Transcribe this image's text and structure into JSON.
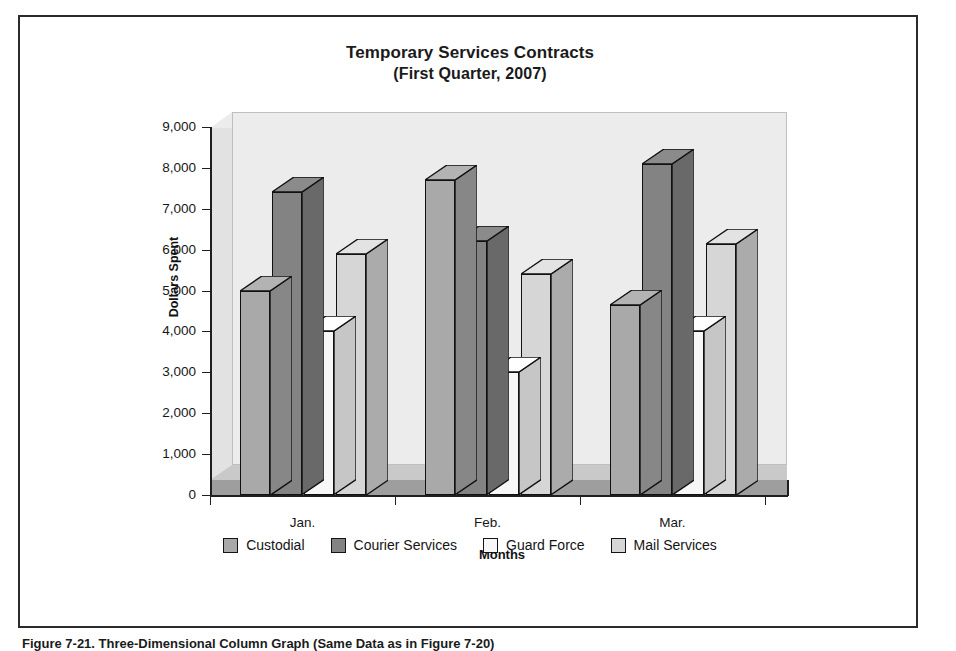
{
  "figure": {
    "caption": "Figure 7-21.  Three-Dimensional Column Graph (Same Data as in Figure 7-20)"
  },
  "chart_data": {
    "type": "bar",
    "title": "Temporary Services Contracts",
    "subtitle": "(First Quarter, 2007)",
    "xlabel": "Months",
    "ylabel": "Dollars Spent",
    "categories": [
      "Jan.",
      "Feb.",
      "Mar."
    ],
    "ylim": [
      0,
      9000
    ],
    "ytick_labels": [
      "9,000",
      "8,000",
      "7,000",
      "6,000",
      "5,000",
      "4,000",
      "3,000",
      "2,000",
      "1,000",
      "0"
    ],
    "ytick_values": [
      9000,
      8000,
      7000,
      6000,
      5000,
      4000,
      3000,
      2000,
      1000,
      0
    ],
    "grid": false,
    "legend_position": "bottom",
    "three_dimensional": true,
    "series": [
      {
        "name": "Custodial",
        "color": "#a9a9a9",
        "values": [
          5000,
          7700,
          4650
        ]
      },
      {
        "name": "Courier Services",
        "color": "#838383",
        "values": [
          7400,
          6200,
          8100
        ]
      },
      {
        "name": "Guard Force",
        "color": "#f7f7f7",
        "values": [
          4000,
          3000,
          4000
        ]
      },
      {
        "name": "Mail Services",
        "color": "#d6d6d6",
        "values": [
          5900,
          5400,
          6150
        ]
      }
    ]
  },
  "colors": {
    "plot_back_wall": "#ececec",
    "plot_side_wall": "#e2e2e2",
    "floor_top": "#c9c9c9",
    "floor_front": "#9e9e9e",
    "outline": "#111111",
    "frame_border": "#2b2b2b"
  }
}
